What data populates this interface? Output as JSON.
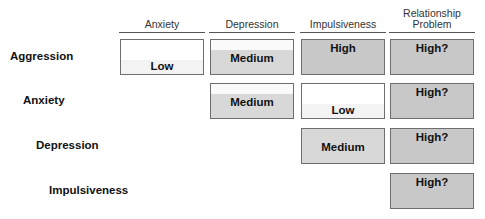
{
  "columns": [
    {
      "label": "Anxiety"
    },
    {
      "label": "Depression"
    },
    {
      "label": "Impulsiveness"
    },
    {
      "label_line1": "Relationship",
      "label_line2": "Problem"
    }
  ],
  "rows": [
    {
      "label": "Aggression"
    },
    {
      "label": "Anxiety"
    },
    {
      "label": "Depression"
    },
    {
      "label": "Impulsiveness"
    }
  ],
  "cells": {
    "r0c0": "Low",
    "r0c1": "Medium",
    "r0c2": "High",
    "r0c3": "High?",
    "r1c1": "Medium",
    "r1c2": "Low",
    "r1c3": "High?",
    "r2c2": "Medium",
    "r2c3": "High?",
    "r3c3": "High?"
  },
  "colors": {
    "low": "#ffffff",
    "medium": "#d8d8d8",
    "high": "#c8c8c8",
    "border": "#6e6e6e"
  }
}
